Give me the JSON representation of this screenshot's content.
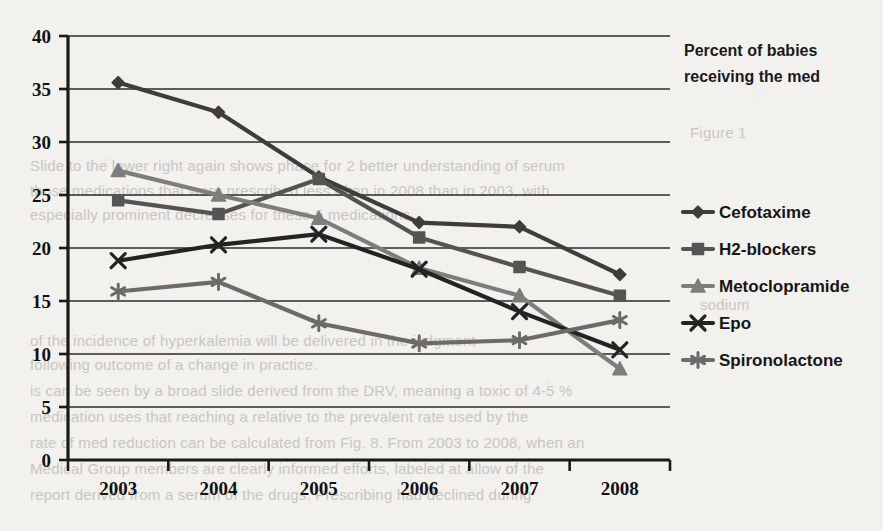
{
  "chart_data": {
    "type": "line",
    "title_lines": [
      "Percent of babies",
      "receiving the med"
    ],
    "xlabel": "",
    "ylabel": "",
    "categories": [
      "2003",
      "2004",
      "2005",
      "2006",
      "2007",
      "2008"
    ],
    "ylim": [
      0,
      40
    ],
    "ytick_labels": [
      "0",
      "5",
      "10",
      "15",
      "20",
      "25",
      "30",
      "35",
      "40"
    ],
    "ytick_values": [
      0,
      5,
      10,
      15,
      20,
      25,
      30,
      35,
      40
    ],
    "grid": true,
    "legend_position": "right",
    "series": [
      {
        "name": "Cefotaxime",
        "marker": "diamond",
        "color": "#3d3d3d",
        "values": [
          35.6,
          32.8,
          26.7,
          22.4,
          22.0,
          17.5
        ]
      },
      {
        "name": "H2-blockers",
        "marker": "square",
        "color": "#545454",
        "values": [
          24.5,
          23.2,
          26.5,
          21.0,
          18.2,
          15.5
        ]
      },
      {
        "name": "Metoclopramide",
        "marker": "triangle",
        "color": "#7d7d7d",
        "values": [
          27.3,
          25.0,
          22.8,
          18.1,
          15.5,
          8.6
        ]
      },
      {
        "name": "Epo",
        "marker": "x",
        "color": "#232323",
        "values": [
          18.8,
          20.3,
          21.3,
          18.0,
          14.0,
          10.4
        ]
      },
      {
        "name": "Spironolactone",
        "marker": "star",
        "color": "#6b6b6b",
        "values": [
          15.9,
          16.8,
          12.9,
          11.0,
          11.3,
          13.2
        ]
      }
    ]
  },
  "background_text": {
    "lines": [
      {
        "text": "Figure 1",
        "x": 690,
        "y": 124
      },
      {
        "text": "Slide to the lower right again shows phase for 2 better understanding of serum",
        "x": 30,
        "y": 157
      },
      {
        "text": "those medications that were prescribed less often in 2008 than in 2003, with",
        "x": 30,
        "y": 182
      },
      {
        "text": "especially prominent decreases for these 5 medications.",
        "x": 30,
        "y": 206
      },
      {
        "text": "sodium",
        "x": 700,
        "y": 296
      },
      {
        "text": "of the incidence of hyperkalemia will be delivered in the judgment",
        "x": 30,
        "y": 332
      },
      {
        "text": "following outcome of a change in practice.",
        "x": 30,
        "y": 356
      },
      {
        "text": "is can be seen by a broad slide derived from the DRV, meaning a toxic of 4-5 %",
        "x": 30,
        "y": 382
      },
      {
        "text": "medication uses that reaching a relative to the prevalent rate used by the",
        "x": 30,
        "y": 408
      },
      {
        "text": "rate of med reduction can be calculated from Fig. 8. From 2003 to 2008, when an",
        "x": 30,
        "y": 434
      },
      {
        "text": "Medical Group members are clearly informed efforts, labeled at allow of the",
        "x": 30,
        "y": 460
      },
      {
        "text": "report derived from a serum of the drugs. Prescribing had declined during",
        "x": 30,
        "y": 486
      }
    ]
  }
}
